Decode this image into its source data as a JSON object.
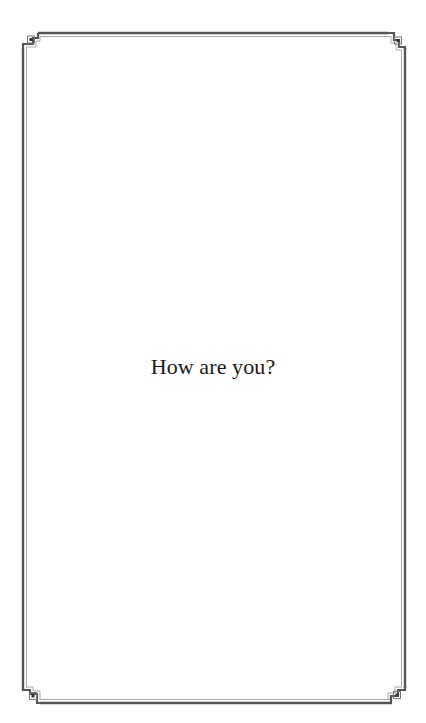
{
  "card": {
    "message": "How are you?",
    "border_style": "double-line-fret-corners",
    "colors": {
      "background": "#ffffff",
      "border_outer": "#555555",
      "border_inner": "#a8a8a8",
      "text": "#1a1a1a"
    }
  }
}
